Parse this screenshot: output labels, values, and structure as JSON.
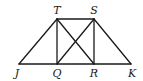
{
  "diagram": {
    "points": {
      "T": {
        "label": "T",
        "x": 57,
        "y": 19
      },
      "S": {
        "label": "S",
        "x": 94,
        "y": 19
      },
      "J": {
        "label": "J",
        "x": 19,
        "y": 64
      },
      "Q": {
        "label": "Q",
        "x": 57,
        "y": 64
      },
      "R": {
        "label": "R",
        "x": 94,
        "y": 64
      },
      "K": {
        "label": "K",
        "x": 131,
        "y": 64
      }
    },
    "segments": [
      [
        "T",
        "S"
      ],
      [
        "J",
        "K"
      ],
      [
        "J",
        "T"
      ],
      [
        "S",
        "K"
      ],
      [
        "T",
        "Q"
      ],
      [
        "S",
        "R"
      ],
      [
        "T",
        "R"
      ],
      [
        "S",
        "Q"
      ]
    ],
    "labels": {
      "T": "T",
      "S": "S",
      "J": "J",
      "Q": "Q",
      "R": "R",
      "K": "K"
    }
  }
}
